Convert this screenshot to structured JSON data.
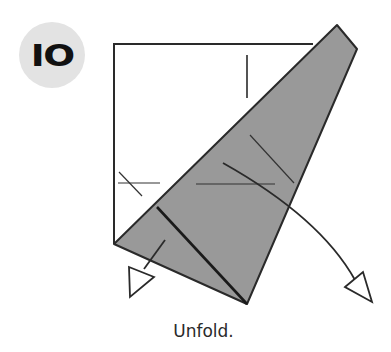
{
  "step": {
    "number": "IO",
    "badge_color": "#e3e3e3"
  },
  "instruction": "Unfold.",
  "colors": {
    "paper_front": "#ffffff",
    "paper_back": "#999999",
    "line": "#2a2a2a"
  },
  "diagram": {
    "square_edges": "white unfolded square with fold lines",
    "flap": "gray folded triangular flap",
    "arrows": [
      "unfold-arrow-small",
      "unfold-arrow-large"
    ]
  }
}
